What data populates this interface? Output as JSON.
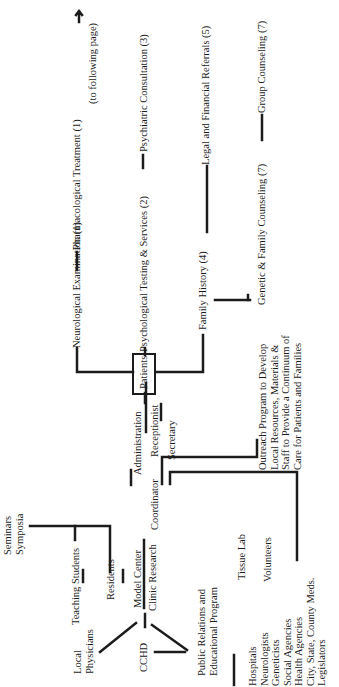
{
  "diagram": {
    "orientation": "rotated-90-ccw",
    "ink_color": "#1c1c1c",
    "background": "#ffffff",
    "nodes": {
      "neurological_exam": "Neurological Examination (1)",
      "pharmacological": "Pharmacological Treatment (1)",
      "following_page": "(to following page)",
      "arrow": "→",
      "psych_testing": "Psychological Testing & Services (2)",
      "psychiatric_consult": "Psychiatric Consultation (3)",
      "family_history": "Family History (4)",
      "legal_financial": "Legal and Financial Referrals (5)",
      "genetic_family": "Genetic & Family Counseling (7)",
      "group_counseling": "Group Counseling (7)",
      "patients": "Patients",
      "outreach": "Outreach Program to Develop\nLocal Resources, Materials &\nStaff to Provide a Continuum of\nCare for Patients and Families",
      "administration": "Administration",
      "coordinator": "Coordinator",
      "receptionist": "Receptionist",
      "secretary": "Secretary",
      "seminars": "Seminars\nSymposia",
      "teaching_students": "Teaching Students",
      "residents": "Residents",
      "model_center": "Model Center",
      "clinic_research": "Clinic Research",
      "local_physicians": "Local\nPhysicians",
      "cchd": "CCHD",
      "tissue_lab": "Tissue Lab",
      "volunteers": "Volunteers",
      "public_relations": "Public Relations and\nEducational Program",
      "community": "Hospitals\nNeurologists\nGeneticists\nSocial Agencies\nHealth Agencies\nCity, State, County Meds.\nLegislators"
    }
  }
}
